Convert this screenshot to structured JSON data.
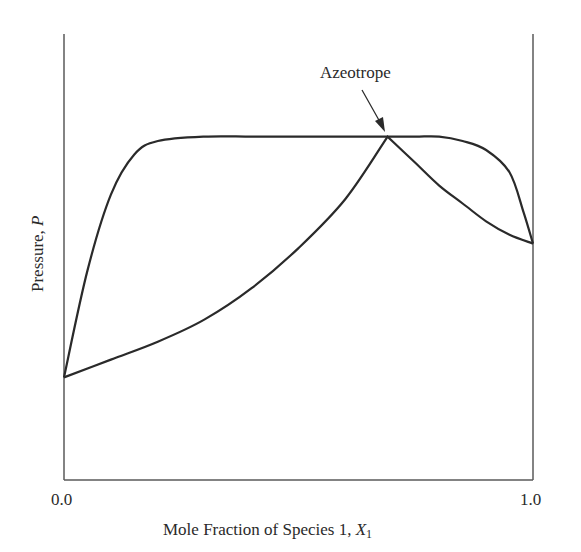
{
  "chart_data": {
    "type": "line",
    "title": "",
    "xlabel": "Mole Fraction of Species 1, X1",
    "xlabel_parts": {
      "text": "Mole Fraction of Species 1, ",
      "var": "X",
      "sub": "1"
    },
    "ylabel": "Pressure, P",
    "ylabel_parts": {
      "text": "Pressure, ",
      "var": "P"
    },
    "xlim": [
      0.0,
      1.0
    ],
    "ylim": [
      0.0,
      1.0
    ],
    "x_ticks": [
      "0.0",
      "1.0"
    ],
    "y_ticks": [],
    "grid": false,
    "legend": null,
    "annotations": [
      {
        "text": "Azeotrope",
        "x": 0.69,
        "y": 0.77,
        "arrow": true
      }
    ],
    "series": [
      {
        "name": "Dew-point curve (vapor)",
        "x": [
          0.0,
          0.05,
          0.1,
          0.15,
          0.2,
          0.3,
          0.4,
          0.5,
          0.6,
          0.69,
          0.75,
          0.8,
          0.85,
          0.9,
          0.95,
          0.98,
          1.0
        ],
        "y": [
          0.23,
          0.47,
          0.64,
          0.73,
          0.76,
          0.77,
          0.77,
          0.77,
          0.77,
          0.77,
          0.77,
          0.77,
          0.76,
          0.74,
          0.69,
          0.6,
          0.53
        ]
      },
      {
        "name": "Bubble-point curve (liquid)",
        "x": [
          0.0,
          0.1,
          0.2,
          0.3,
          0.4,
          0.5,
          0.6,
          0.69,
          0.75,
          0.8,
          0.85,
          0.9,
          0.95,
          1.0
        ],
        "y": [
          0.23,
          0.27,
          0.31,
          0.36,
          0.43,
          0.52,
          0.63,
          0.77,
          0.71,
          0.66,
          0.62,
          0.58,
          0.55,
          0.53
        ]
      }
    ],
    "colors": {
      "line": "#2a2a2a",
      "axis": "#555555",
      "background": "#ffffff"
    }
  }
}
